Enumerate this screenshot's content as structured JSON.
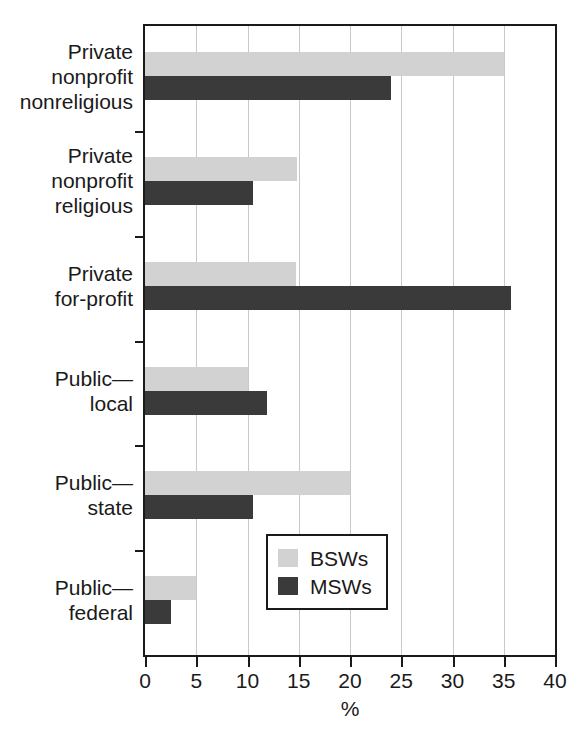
{
  "chart_data": {
    "type": "bar",
    "orientation": "horizontal",
    "title": "",
    "xlabel": "%",
    "ylabel": "",
    "xlim": [
      0,
      40
    ],
    "xticks": [
      0,
      5,
      10,
      15,
      20,
      25,
      30,
      35,
      40
    ],
    "xtick_labels": [
      "0",
      "5",
      "10",
      "15",
      "20",
      "25",
      "30",
      "35",
      "40"
    ],
    "grid": "vertical",
    "legend_position": "bottom-right",
    "categories": [
      "Private nonprofit nonreligious",
      "Private nonprofit religious",
      "Private for-profit",
      "Public—local",
      "Public—state",
      "Public—federal"
    ],
    "category_lines": [
      [
        "Private",
        "nonprofit",
        "nonreligious"
      ],
      [
        "Private",
        "nonprofit",
        "religious"
      ],
      [
        "Private",
        "for-profit"
      ],
      [
        "Public—",
        "local"
      ],
      [
        "Public—",
        "state"
      ],
      [
        "Public—",
        "federal"
      ]
    ],
    "series": [
      {
        "name": "BSWs",
        "color": "#d2d2d2",
        "values": [
          35.0,
          14.8,
          14.7,
          10.0,
          20.0,
          5.0
        ]
      },
      {
        "name": "MSWs",
        "color": "#3a3a3a",
        "values": [
          24.0,
          10.5,
          35.7,
          11.9,
          10.5,
          2.5
        ]
      }
    ]
  },
  "legend": {
    "entries": [
      {
        "label": "BSWs",
        "swatch_name": "legend-swatch-bsws"
      },
      {
        "label": "MSWs",
        "swatch_name": "legend-swatch-msws"
      }
    ]
  },
  "axis": {
    "x_title": "%"
  }
}
